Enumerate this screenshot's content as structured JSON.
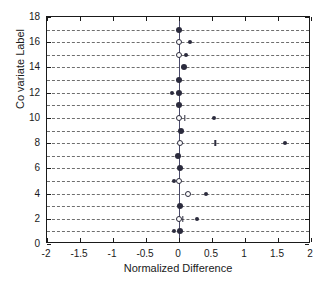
{
  "chart_data": {
    "type": "scatter",
    "title": "",
    "xlabel": "Normalized Difference",
    "ylabel": "Co variate Label",
    "xlim": [
      -2,
      2
    ],
    "ylim": [
      0,
      18
    ],
    "xticks": [
      -2,
      -1.5,
      -1,
      -0.5,
      0,
      0.5,
      1,
      1.5,
      2
    ],
    "xticklabels": [
      "-2",
      "-1.5",
      "-1",
      "-0.5",
      "0",
      "0.5",
      "1",
      "1.5",
      "2"
    ],
    "yticks": [
      0,
      2,
      4,
      6,
      8,
      10,
      12,
      14,
      16,
      18
    ],
    "yticklabels": [
      "0",
      "2",
      "4",
      "6",
      "8",
      "10",
      "12",
      "14",
      "16",
      "18"
    ],
    "grid": "horizontal-dashed-at-each-integer",
    "reference_line_x": 0,
    "legend": "none",
    "points": [
      {
        "y": 17,
        "x": 0.0,
        "marker": "filled"
      },
      {
        "y": 16,
        "x": 0.0,
        "marker": "open"
      },
      {
        "y": 16,
        "x": 0.17,
        "marker": "dot"
      },
      {
        "y": 15,
        "x": 0.0,
        "marker": "open"
      },
      {
        "y": 15,
        "x": 0.1,
        "marker": "dot"
      },
      {
        "y": 14,
        "x": 0.07,
        "marker": "filled"
      },
      {
        "y": 13,
        "x": 0.0,
        "marker": "filled"
      },
      {
        "y": 12,
        "x": 0.0,
        "marker": "filled"
      },
      {
        "y": 12,
        "x": -0.1,
        "marker": "dot"
      },
      {
        "y": 11,
        "x": 0.0,
        "marker": "filled"
      },
      {
        "y": 10,
        "x": 0.0,
        "marker": "open"
      },
      {
        "y": 10,
        "x": 0.09,
        "marker": "tick"
      },
      {
        "y": 10,
        "x": 0.53,
        "marker": "dot"
      },
      {
        "y": 9,
        "x": 0.03,
        "marker": "filled"
      },
      {
        "y": 8,
        "x": 0.01,
        "marker": "open"
      },
      {
        "y": 8,
        "x": 0.55,
        "marker": "tick"
      },
      {
        "y": 8,
        "x": 1.61,
        "marker": "dot"
      },
      {
        "y": 7,
        "x": -0.01,
        "marker": "filled"
      },
      {
        "y": 6,
        "x": 0.01,
        "marker": "filled"
      },
      {
        "y": 5,
        "x": 0.0,
        "marker": "open"
      },
      {
        "y": 5,
        "x": -0.08,
        "marker": "dot"
      },
      {
        "y": 4,
        "x": 0.13,
        "marker": "open"
      },
      {
        "y": 4,
        "x": 0.41,
        "marker": "dot"
      },
      {
        "y": 3,
        "x": 0.01,
        "marker": "filled"
      },
      {
        "y": 2,
        "x": 0.0,
        "marker": "open"
      },
      {
        "y": 2,
        "x": 0.06,
        "marker": "tick"
      },
      {
        "y": 2,
        "x": 0.27,
        "marker": "dot"
      },
      {
        "y": 1,
        "x": 0.01,
        "marker": "filled"
      },
      {
        "y": 1,
        "x": -0.07,
        "marker": "dot"
      }
    ]
  },
  "colors": {
    "axis": "#1a1a1a",
    "grid": "#555555",
    "marker": "#2b2b3d",
    "zeroline": "#4a4a6a",
    "background": "#ffffff"
  }
}
